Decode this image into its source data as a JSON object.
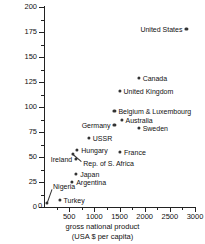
{
  "chart_data": {
    "type": "scatter",
    "title": "",
    "xlabel": "gross national product (USA $ per capita)",
    "ylabel": "commercial energy consumption (million BTU annually per capita)",
    "xlabel_line1": "gross national product",
    "xlabel_line2": "(USA $ per capita)",
    "ylabel_line1": "commercial energy consumption",
    "ylabel_line2": "(million BTU annually per capita)",
    "xlim": [
      0,
      3000
    ],
    "ylim": [
      0,
      200
    ],
    "x_ticks": [
      0,
      500,
      1000,
      1500,
      2000,
      2500,
      3000
    ],
    "x_tick_labels": [
      "0",
      "500",
      "1000",
      "1500",
      "2000",
      "2500",
      "3000"
    ],
    "x_minor_ticks": [
      250,
      750,
      1250,
      1750,
      2250,
      2750
    ],
    "y_ticks": [
      0,
      25,
      50,
      75,
      100,
      125,
      150,
      175,
      200
    ],
    "y_tick_labels": [
      "0",
      "25",
      "50",
      "75",
      "100",
      "125",
      "150",
      "175",
      "200"
    ],
    "y_minor_ticks": [
      12.5,
      37.5,
      62.5,
      87.5,
      112.5,
      137.5,
      162.5,
      187.5
    ],
    "grid": false,
    "legend": false,
    "points": [
      {
        "name": "United States",
        "x": 2830,
        "y": 178,
        "label_side": "left",
        "leader": false
      },
      {
        "name": "Canada",
        "x": 1880,
        "y": 129,
        "label_side": "right",
        "leader": false
      },
      {
        "name": "United Kingdom",
        "x": 1500,
        "y": 116,
        "label_side": "right",
        "leader": false
      },
      {
        "name": "Belgium & Luxembourg",
        "x": 1400,
        "y": 96,
        "label_side": "right",
        "leader": false
      },
      {
        "name": "Australia",
        "x": 1540,
        "y": 87,
        "label_side": "right",
        "leader": false
      },
      {
        "name": "Germany",
        "x": 1400,
        "y": 82,
        "label_side": "left",
        "leader": false
      },
      {
        "name": "Sweden",
        "x": 1880,
        "y": 79,
        "label_side": "right",
        "leader": false
      },
      {
        "name": "USSR",
        "x": 890,
        "y": 69,
        "label_side": "right",
        "leader": false
      },
      {
        "name": "Hungary",
        "x": 660,
        "y": 57,
        "label_side": "right",
        "leader": false
      },
      {
        "name": "France",
        "x": 1510,
        "y": 55,
        "label_side": "right",
        "leader": false
      },
      {
        "name": "Rep. of S. Africa",
        "x": 570,
        "y": 53,
        "label_side": "right",
        "leader": true,
        "label_x": 780,
        "label_y": 44
      },
      {
        "name": "Ireland",
        "x": 640,
        "y": 48,
        "label_side": "left",
        "leader": false
      },
      {
        "name": "Japan",
        "x": 640,
        "y": 33,
        "label_side": "right",
        "leader": false
      },
      {
        "name": "Argentina",
        "x": 560,
        "y": 25,
        "label_side": "right",
        "leader": false
      },
      {
        "name": "Turkey",
        "x": 310,
        "y": 7,
        "label_side": "right",
        "leader": false
      },
      {
        "name": "Nigeria",
        "x": 60,
        "y": 4,
        "label_side": "right",
        "leader": true,
        "label_x": 180,
        "label_y": 21
      }
    ],
    "marker_color": "#333333",
    "axis_color": "#222222",
    "background_color": "#ffffff"
  }
}
